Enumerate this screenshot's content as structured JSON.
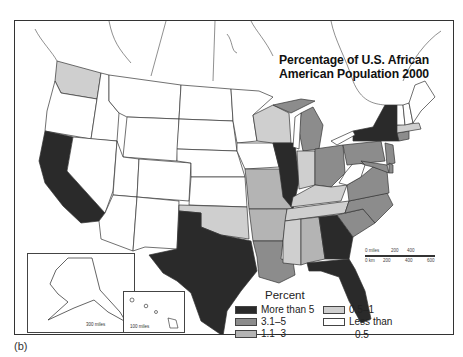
{
  "title": {
    "line1": "Percentage of U.S. African",
    "line2": "American Population 2000"
  },
  "legend": {
    "title": "Percent",
    "items": [
      {
        "label": "More than 5",
        "color": "#2a2a2a"
      },
      {
        "label": "3.1–5",
        "color": "#8c8c8c"
      },
      {
        "label": "1.1–3",
        "color": "#b4b4b4"
      },
      {
        "label": "0.5–1",
        "color": "#cfcfcf"
      },
      {
        "label": "Less than",
        "label2": "0.5",
        "color": "#ffffff"
      }
    ]
  },
  "scale_bar": {
    "miles_label": "0 miles",
    "miles_ticks": [
      "200",
      "400"
    ],
    "km_label": "0 km",
    "km_ticks": [
      "200",
      "400",
      "600"
    ]
  },
  "insets": {
    "alaska": {
      "scale": "300 miles"
    },
    "hawaii": {
      "scale": "100 miles"
    }
  },
  "caption": "(b)",
  "colors": {
    "more_than_5": "#2a2a2a",
    "c3_1_5": "#8c8c8c",
    "c1_1_3": "#b4b4b4",
    "c0_5_1": "#cfcfcf",
    "less_than_0_5": "#ffffff"
  }
}
